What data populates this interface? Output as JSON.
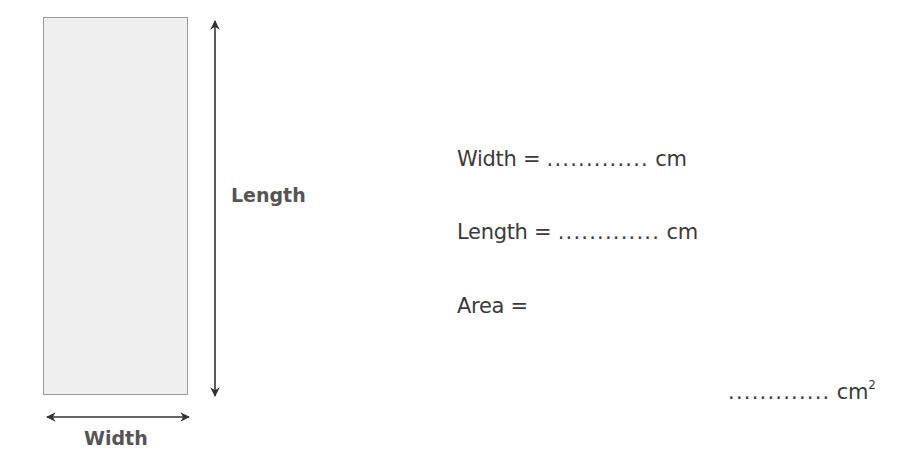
{
  "diagram": {
    "shape": "rectangle",
    "length_label": "Length",
    "width_label": "Width",
    "colors": {
      "fill": "#efefef",
      "border": "#9a9a9a",
      "arrow": "#333333",
      "label": "#555555"
    }
  },
  "worksheet": {
    "width_line": {
      "label": "Width =",
      "blank": ".............",
      "unit": "cm"
    },
    "length_line": {
      "label": "Length =",
      "blank": ".............",
      "unit": "cm"
    },
    "area_line": {
      "label": "Area =",
      "blank": ".............",
      "unit": "cm",
      "unit_sup": "2"
    }
  }
}
